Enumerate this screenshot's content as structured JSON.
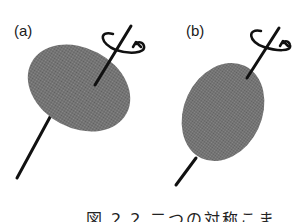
{
  "figure": {
    "panels": [
      {
        "label": "(a)",
        "shape": "oblate-ellipsoid",
        "description": "wide ellipse rotating about tilted axis"
      },
      {
        "label": "(b)",
        "shape": "prolate-ellipsoid",
        "description": "tall ellipse rotating about tilted axis"
      }
    ],
    "caption": "図 2.2 二つの対称こま",
    "colors": {
      "body_fill": "#7a7a7a",
      "axis": "#111111",
      "background": "#ffffff"
    },
    "icons": [
      "rotation-arrow-icon",
      "rotation-arrow-icon"
    ]
  }
}
